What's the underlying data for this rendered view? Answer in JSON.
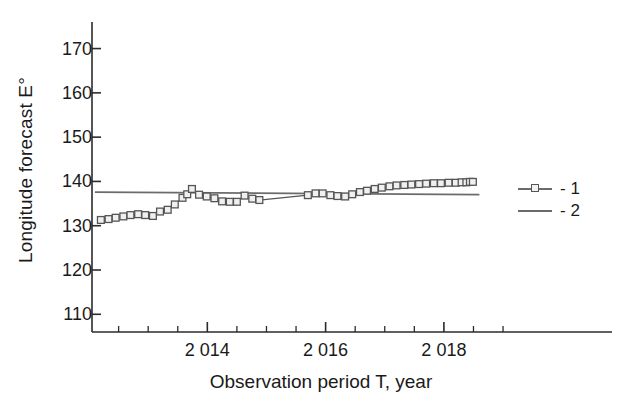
{
  "chart_data": {
    "type": "line",
    "title": "",
    "xlabel": "Observation period T, year",
    "ylabel": "Longitude forecast E°",
    "xlim": [
      2012.05,
      2019.05
    ],
    "ylim": [
      106,
      176
    ],
    "grid": false,
    "legend_position": "right",
    "y_ticks": [
      110,
      120,
      130,
      140,
      150,
      160,
      170
    ],
    "y_tick_labels": [
      "110",
      "120",
      "130",
      "140",
      "150",
      "160",
      "170"
    ],
    "y_minor_step": 5,
    "x_ticks": [
      2014,
      2016,
      2018
    ],
    "x_tick_labels": [
      "2 014",
      "2 016",
      "2 018"
    ],
    "x_minor_step": 0.25,
    "series": [
      {
        "name": "1",
        "legend_label": "- 1",
        "marker": "open-square",
        "color": "#555555",
        "points": [
          [
            2012.2,
            131.3
          ],
          [
            2012.33,
            131.5
          ],
          [
            2012.45,
            131.8
          ],
          [
            2012.58,
            132.1
          ],
          [
            2012.7,
            132.4
          ],
          [
            2012.83,
            132.6
          ],
          [
            2012.95,
            132.4
          ],
          [
            2013.08,
            132.2
          ],
          [
            2013.2,
            133.2
          ],
          [
            2013.33,
            133.6
          ],
          [
            2013.45,
            134.8
          ],
          [
            2013.58,
            136.3
          ],
          [
            2013.66,
            137.1
          ],
          [
            2013.74,
            138.3
          ],
          [
            2013.86,
            137.0
          ],
          [
            2013.99,
            136.6
          ],
          [
            2014.12,
            136.2
          ],
          [
            2014.25,
            135.5
          ],
          [
            2014.38,
            135.4
          ],
          [
            2014.5,
            135.4
          ],
          [
            2014.63,
            136.8
          ],
          [
            2014.76,
            136.1
          ],
          [
            2014.88,
            135.8
          ],
          [
            2015.7,
            136.9
          ],
          [
            2015.83,
            137.3
          ],
          [
            2015.95,
            137.3
          ],
          [
            2016.08,
            136.9
          ],
          [
            2016.2,
            136.7
          ],
          [
            2016.33,
            136.6
          ],
          [
            2016.45,
            137.1
          ],
          [
            2016.58,
            137.6
          ],
          [
            2016.7,
            137.9
          ],
          [
            2016.83,
            138.3
          ],
          [
            2016.95,
            138.6
          ],
          [
            2017.08,
            138.9
          ],
          [
            2017.2,
            139.1
          ],
          [
            2017.33,
            139.2
          ],
          [
            2017.45,
            139.3
          ],
          [
            2017.58,
            139.4
          ],
          [
            2017.7,
            139.5
          ],
          [
            2017.83,
            139.6
          ],
          [
            2017.95,
            139.6
          ],
          [
            2018.08,
            139.7
          ],
          [
            2018.2,
            139.7
          ],
          [
            2018.3,
            139.8
          ],
          [
            2018.38,
            139.8
          ],
          [
            2018.44,
            139.9
          ],
          [
            2018.49,
            139.9
          ]
        ]
      },
      {
        "name": "2",
        "legend_label": "- 2",
        "marker": "none",
        "color": "#6b6b6b",
        "points": [
          [
            2012.1,
            137.6
          ],
          [
            2018.6,
            137.0
          ]
        ]
      }
    ]
  }
}
